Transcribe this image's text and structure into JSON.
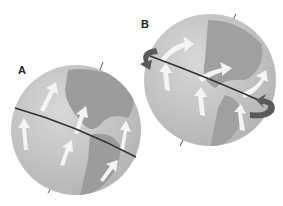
{
  "figure": {
    "panels": [
      {
        "label": "A",
        "description": "Globe with tilted equator line, arrows showing circulation"
      },
      {
        "label": "B",
        "description": "Globe with tilted equator line and curved rotation arrows at the ends"
      }
    ],
    "colors": {
      "ocean": "#c4c4c4",
      "land": "#9a9a9a",
      "equator": "#333333",
      "rotation_arrow": "#5a5a5a",
      "flow_arrow": "#f2f2f2"
    }
  }
}
